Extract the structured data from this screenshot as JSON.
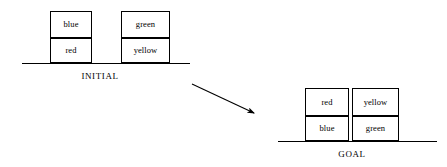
{
  "diagram": {
    "scenes": [
      {
        "id": "initial",
        "caption": "INITIAL",
        "stacks": [
          {
            "id": "stack-blue-red",
            "upper": "blue",
            "lower": "red"
          },
          {
            "id": "stack-green-yellow",
            "upper": "green",
            "lower": "yellow"
          }
        ]
      },
      {
        "id": "goal",
        "caption": "GOAL",
        "stacks": [
          {
            "id": "stack-red-blue",
            "upper": "red",
            "lower": "blue"
          },
          {
            "id": "stack-yellow-green",
            "upper": "yellow",
            "lower": "green"
          }
        ]
      }
    ],
    "arrow": {
      "name": "transition-arrow",
      "direction": "down-right",
      "from": "initial",
      "to": "goal"
    },
    "colors": {
      "ink": "#000000",
      "paper": "#ffffff"
    }
  }
}
